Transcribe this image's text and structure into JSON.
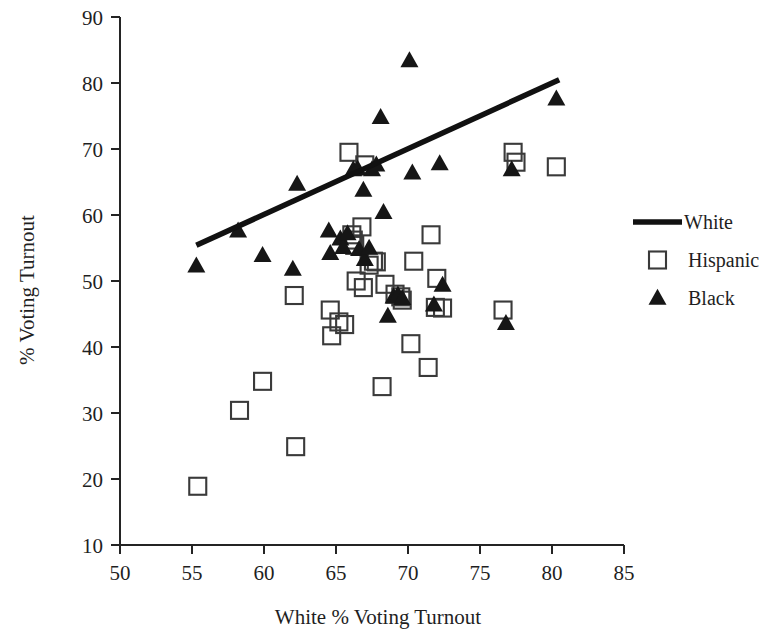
{
  "chart_data": {
    "type": "scatter",
    "title": "",
    "xlabel": "White % Voting Turnout",
    "ylabel": "% Voting Turnout",
    "xlim": [
      50,
      85
    ],
    "ylim": [
      10,
      90
    ],
    "xticks": [
      50,
      55,
      60,
      65,
      70,
      75,
      80,
      85
    ],
    "yticks": [
      10,
      20,
      30,
      40,
      50,
      60,
      70,
      80,
      90
    ],
    "xtick_labels": [
      "50",
      "55",
      "60",
      "65",
      "70",
      "75",
      "80",
      "85"
    ],
    "ytick_labels": [
      "10",
      "20",
      "30",
      "40",
      "50",
      "60",
      "70",
      "80",
      "90"
    ],
    "grid": false,
    "legend_position": "right",
    "legend": [
      {
        "name": "White",
        "marker": "line",
        "color": "#111111"
      },
      {
        "name": "Hispanic",
        "marker": "open-square",
        "color": "#3a3a3a"
      },
      {
        "name": "Black",
        "marker": "filled-triangle",
        "color": "#161616"
      }
    ],
    "series": [
      {
        "name": "White",
        "marker": "line",
        "type": "trendline",
        "x": [
          55.3,
          80.5
        ],
        "y": [
          55.4,
          80.5
        ]
      },
      {
        "name": "Hispanic",
        "marker": "open-square",
        "points": [
          [
            55.4,
            18.9
          ],
          [
            58.3,
            30.4
          ],
          [
            59.9,
            34.8
          ],
          [
            62.2,
            24.9
          ],
          [
            62.1,
            47.8
          ],
          [
            64.6,
            45.6
          ],
          [
            64.7,
            41.7
          ],
          [
            65.2,
            43.8
          ],
          [
            65.6,
            43.4
          ],
          [
            65.9,
            69.5
          ],
          [
            66.1,
            57.0
          ],
          [
            66.2,
            56.2
          ],
          [
            66.4,
            50.0
          ],
          [
            66.3,
            55.4
          ],
          [
            66.8,
            58.2
          ],
          [
            66.9,
            49.0
          ],
          [
            67.0,
            67.6
          ],
          [
            67.3,
            52.4
          ],
          [
            67.6,
            53.0
          ],
          [
            67.8,
            52.9
          ],
          [
            68.2,
            34.0
          ],
          [
            68.4,
            49.5
          ],
          [
            69.1,
            48.0
          ],
          [
            69.5,
            47.6
          ],
          [
            69.6,
            47.1
          ],
          [
            70.2,
            40.5
          ],
          [
            70.4,
            53.0
          ],
          [
            71.4,
            36.9
          ],
          [
            71.6,
            57.0
          ],
          [
            71.9,
            46.0
          ],
          [
            72.0,
            50.4
          ],
          [
            72.4,
            45.9
          ],
          [
            76.6,
            45.6
          ],
          [
            77.3,
            69.5
          ],
          [
            77.5,
            68.0
          ],
          [
            80.3,
            67.3
          ]
        ]
      },
      {
        "name": "Black",
        "marker": "filled-triangle",
        "points": [
          [
            55.3,
            52.3
          ],
          [
            58.2,
            57.6
          ],
          [
            59.9,
            53.9
          ],
          [
            62.0,
            51.8
          ],
          [
            62.3,
            64.7
          ],
          [
            64.5,
            57.6
          ],
          [
            64.6,
            54.2
          ],
          [
            65.3,
            56.4
          ],
          [
            65.5,
            55.1
          ],
          [
            65.8,
            57.2
          ],
          [
            66.2,
            66.9
          ],
          [
            66.5,
            67.0
          ],
          [
            66.6,
            54.8
          ],
          [
            66.9,
            63.8
          ],
          [
            67.0,
            53.3
          ],
          [
            67.3,
            55.0
          ],
          [
            67.5,
            66.9
          ],
          [
            67.8,
            67.6
          ],
          [
            68.1,
            74.8
          ],
          [
            68.3,
            60.4
          ],
          [
            68.6,
            44.7
          ],
          [
            69.0,
            47.6
          ],
          [
            69.3,
            47.9
          ],
          [
            69.6,
            47.4
          ],
          [
            70.1,
            83.4
          ],
          [
            70.3,
            66.4
          ],
          [
            71.8,
            46.4
          ],
          [
            72.2,
            67.8
          ],
          [
            72.4,
            49.4
          ],
          [
            76.8,
            43.6
          ],
          [
            77.2,
            66.9
          ],
          [
            80.3,
            77.6
          ]
        ]
      }
    ]
  },
  "axes": {
    "x_title": "White % Voting Turnout",
    "y_title": "% Voting Turnout"
  },
  "legend": {
    "white_label": "White",
    "hispanic_label": "Hispanic",
    "black_label": "Black"
  }
}
